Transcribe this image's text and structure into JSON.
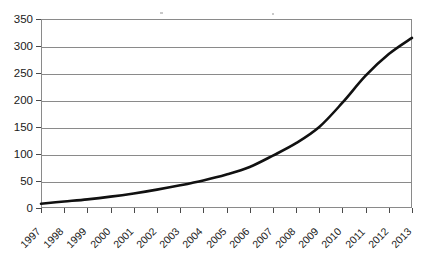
{
  "chart_data": {
    "type": "line",
    "title": "",
    "subtitle": "",
    "xlabel": "",
    "ylabel": "",
    "categories": [
      "1997",
      "1998",
      "1999",
      "2000",
      "2001",
      "2002",
      "2003",
      "2004",
      "2005",
      "2006",
      "2007",
      "2008",
      "2009",
      "2010",
      "2011",
      "2012",
      "2013"
    ],
    "x": [
      1997,
      1998,
      1999,
      2000,
      2001,
      2002,
      2003,
      2004,
      2005,
      2006,
      2007,
      2008,
      2009,
      2010,
      2011,
      2012,
      2013
    ],
    "values": [
      8,
      12,
      16,
      21,
      27,
      34,
      42,
      51,
      62,
      76,
      97,
      120,
      150,
      195,
      245,
      285,
      315
    ],
    "series": [
      {
        "name": "series-1",
        "values": [
          8,
          12,
          16,
          21,
          27,
          34,
          42,
          51,
          62,
          76,
          97,
          120,
          150,
          195,
          245,
          285,
          315
        ],
        "color": "#111111"
      }
    ],
    "ylim": [
      0,
      350
    ],
    "xlim": [
      1997,
      2013
    ],
    "y_ticks": [
      0,
      50,
      100,
      150,
      200,
      250,
      300,
      350
    ],
    "y_tick_labels": [
      "0",
      "50",
      "100",
      "150",
      "200",
      "250",
      "300",
      "350"
    ],
    "x_tick_labels": [
      "1997",
      "1998",
      "1999",
      "2000",
      "2001",
      "2002",
      "2003",
      "2004",
      "2005",
      "2006",
      "2007",
      "2008",
      "2009",
      "2010",
      "2011",
      "2012",
      "2013"
    ],
    "grid": "horizontal",
    "grid_color": "#8a8a8a",
    "legend": "none",
    "legend_position": "none",
    "annotations": [],
    "background_color": "#ffffff",
    "axis_color": "#8a8a8a",
    "x_label_rotation": -45
  }
}
